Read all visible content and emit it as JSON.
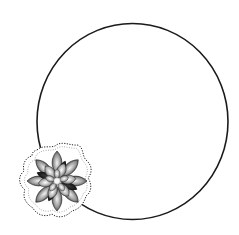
{
  "frame": {
    "shape": "circle",
    "stroke_color": "#1a1a1a",
    "background": "#ffffff"
  },
  "decoration": {
    "icon": "flower-icon",
    "style": "grayscale succulent/lotus sticker with dotted outline",
    "position": "bottom-left"
  }
}
